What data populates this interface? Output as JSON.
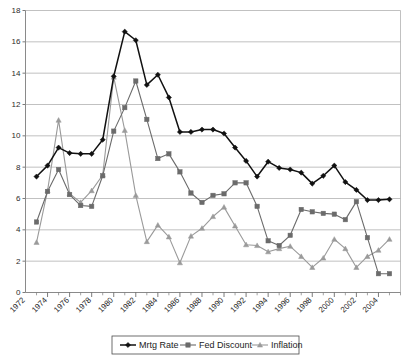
{
  "chart_data": {
    "type": "line",
    "title": "",
    "subtitle": "",
    "xlabel": "",
    "ylabel": "",
    "xlim": [
      1972,
      2006
    ],
    "ylim": [
      0,
      18
    ],
    "grid": true,
    "legend_position": "bottom",
    "x_tick_labels": [
      "1972",
      "1974",
      "1976",
      "1978",
      "1980",
      "1982",
      "1984",
      "1986",
      "1988",
      "1990",
      "1992",
      "1994",
      "1996",
      "1998",
      "2000",
      "2002",
      "2004"
    ],
    "x_tick_values": [
      1972,
      1974,
      1976,
      1978,
      1980,
      1982,
      1984,
      1986,
      1988,
      1990,
      1992,
      1994,
      1996,
      1998,
      2000,
      2002,
      2004
    ],
    "y_tick_labels": [
      "0",
      "2",
      "4",
      "6",
      "8",
      "10",
      "12",
      "14",
      "16",
      "18"
    ],
    "y_tick_values": [
      0,
      2,
      4,
      6,
      8,
      10,
      12,
      14,
      16,
      18
    ],
    "x": [
      1973,
      1974,
      1975,
      1976,
      1977,
      1978,
      1979,
      1980,
      1981,
      1982,
      1983,
      1984,
      1985,
      1986,
      1987,
      1988,
      1989,
      1990,
      1991,
      1992,
      1993,
      1994,
      1995,
      1996,
      1997,
      1998,
      1999,
      2000,
      2001,
      2002,
      2003,
      2004,
      2005
    ],
    "series": [
      {
        "name": "Mrtg Rate",
        "marker": "diamond",
        "color": "#111111",
        "values": [
          7.4,
          8.1,
          9.25,
          8.9,
          8.85,
          8.85,
          9.75,
          13.8,
          16.65,
          16.1,
          13.25,
          13.9,
          12.45,
          10.25,
          10.25,
          10.4,
          10.4,
          10.15,
          9.25,
          8.4,
          7.4,
          8.35,
          7.95,
          7.85,
          7.65,
          6.95,
          7.45,
          8.1,
          7.05,
          6.55,
          5.9,
          5.9,
          5.95
        ]
      },
      {
        "name": "Fed Discount",
        "marker": "square",
        "color": "#6b6b6b",
        "values": [
          4.5,
          6.45,
          7.85,
          6.25,
          5.55,
          5.5,
          7.45,
          10.3,
          11.8,
          13.5,
          11.05,
          8.55,
          8.85,
          7.7,
          6.35,
          5.75,
          6.2,
          6.3,
          7.0,
          7.0,
          5.5,
          3.3,
          3.0,
          3.65,
          5.3,
          5.15,
          5.05,
          5.0,
          4.65,
          5.8,
          3.5,
          1.2,
          1.2
        ]
      },
      {
        "name": "Inflation",
        "marker": "triangle",
        "color": "#9a9a9a",
        "values": [
          3.2,
          6.5,
          11.0,
          6.3,
          5.75,
          6.5,
          7.5,
          13.75,
          10.35,
          6.2,
          3.25,
          4.3,
          3.55,
          1.9,
          3.6,
          4.1,
          4.85,
          5.45,
          4.25,
          3.05,
          3.0,
          2.6,
          2.8,
          2.95,
          2.3,
          1.6,
          2.2,
          3.4,
          2.8,
          1.6,
          2.3,
          2.7,
          3.4
        ]
      }
    ]
  },
  "legend": {
    "items": [
      {
        "label": "Mrtg Rate",
        "marker": "diamond-marker"
      },
      {
        "label": "Fed Discount",
        "marker": "square-marker"
      },
      {
        "label": "Inflation",
        "marker": "triangle-marker"
      }
    ]
  }
}
